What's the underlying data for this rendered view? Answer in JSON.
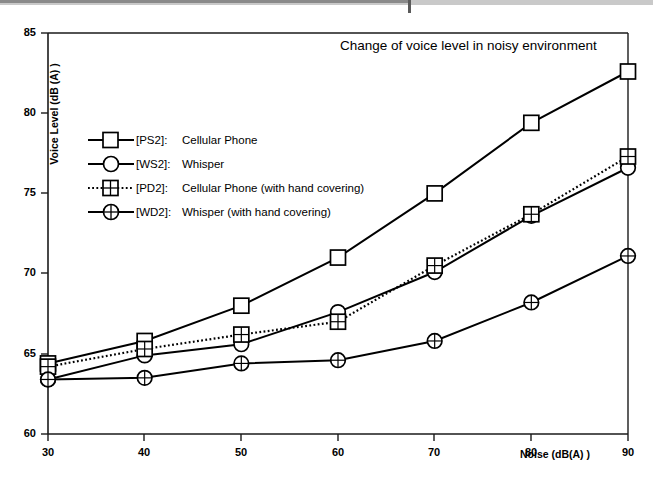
{
  "chart_data": {
    "type": "line",
    "title": "Change of voice level in noisy environment",
    "xlabel": "Noise (dB(A) )",
    "ylabel": "Voice Level (dB (A) )",
    "x": [
      30,
      40,
      50,
      60,
      70,
      80,
      90
    ],
    "xlim": [
      30,
      90
    ],
    "ylim": [
      60,
      85
    ],
    "xticks": [
      "30",
      "40",
      "50",
      "60",
      "70",
      "80",
      "90"
    ],
    "yticks": [
      "60",
      "65",
      "70",
      "75",
      "80",
      "85"
    ],
    "grid": false,
    "legend_position": "inside-upper-left",
    "series": [
      {
        "name": "[PS2]:  Cellular Phone",
        "key": "[PS2]:",
        "label": "Cellular Phone",
        "marker": "square",
        "line": "solid",
        "color": "#000000",
        "values": [
          64.4,
          65.8,
          68.0,
          71.0,
          75.0,
          79.4,
          82.6
        ]
      },
      {
        "name": "[WS2]:  Whisper",
        "key": "[WS2]:",
        "label": "Whisper",
        "marker": "circle",
        "line": "solid",
        "color": "#000000",
        "values": [
          63.4,
          64.9,
          65.6,
          67.6,
          70.1,
          73.6,
          76.6
        ]
      },
      {
        "name": "[PD2]:  Cellular Phone (with hand covering)",
        "key": "[PD2]:",
        "label": "Cellular Phone (with hand covering)",
        "marker": "square-crossed",
        "line": "dotted",
        "color": "#000000",
        "values": [
          64.2,
          65.3,
          66.2,
          67.0,
          70.5,
          73.7,
          77.3
        ]
      },
      {
        "name": "[WD2]:  Whisper (with hand covering)",
        "key": "[WD2]:",
        "label": "Whisper (with hand covering)",
        "marker": "circle-crossed",
        "line": "solid",
        "color": "#000000",
        "values": [
          63.4,
          63.5,
          64.4,
          64.6,
          65.8,
          68.2,
          71.1
        ]
      }
    ]
  },
  "axes": {
    "y_ticks": [
      {
        "value": "85",
        "y": 33
      },
      {
        "value": "80",
        "y": 113
      },
      {
        "value": "75",
        "y": 193
      },
      {
        "value": "70",
        "y": 273
      },
      {
        "value": "65",
        "y": 354
      },
      {
        "value": "60",
        "y": 434
      }
    ],
    "x_ticks": [
      {
        "value": "30",
        "x": 48
      },
      {
        "value": "40",
        "x": 144
      },
      {
        "value": "50",
        "x": 241
      },
      {
        "value": "60",
        "x": 338
      },
      {
        "value": "70",
        "x": 434
      },
      {
        "value": "80",
        "x": 531
      },
      {
        "value": "90",
        "x": 628
      }
    ]
  },
  "legend": {
    "items": [
      {
        "key": "[PS2]:",
        "label": "Cellular Phone"
      },
      {
        "key": "[WS2]:",
        "label": "Whisper"
      },
      {
        "key": "[PD2]:",
        "label": "Cellular Phone (with hand covering)"
      },
      {
        "key": "[WD2]:",
        "label": "Whisper (with hand covering)"
      }
    ]
  }
}
